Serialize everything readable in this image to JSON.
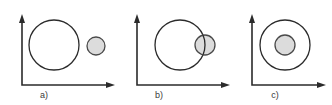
{
  "figure": {
    "width": 332,
    "height": 105,
    "background_color": "#ffffff",
    "stroke_color": "#2b2b2b",
    "fill_gray": "#dcdcdc",
    "small_circle_stroke": "#4a4a4a"
  },
  "panels": [
    {
      "id": "panel-a",
      "label": "a)",
      "label_x": 44,
      "label_y": 98,
      "relation": "disjoint",
      "axis": {
        "origin_x": 22,
        "origin_y": 85,
        "y_top": 14,
        "x_right": 115
      },
      "large_circle": {
        "cx": 54,
        "cy": 45,
        "r": 25,
        "fill": "#ffffff"
      },
      "small_circle": {
        "cx": 96,
        "cy": 46,
        "r": 9,
        "fill": "#dcdcdc"
      }
    },
    {
      "id": "panel-b",
      "label": "b)",
      "label_x": 159,
      "label_y": 98,
      "relation": "overlapping",
      "axis": {
        "origin_x": 137,
        "origin_y": 85,
        "y_top": 14,
        "x_right": 230
      },
      "large_circle": {
        "cx": 180,
        "cy": 45,
        "r": 25,
        "fill": "#ffffff"
      },
      "small_circle": {
        "cx": 205,
        "cy": 45,
        "r": 10,
        "fill": "#dcdcdc"
      }
    },
    {
      "id": "panel-c",
      "label": "c)",
      "label_x": 275,
      "label_y": 98,
      "relation": "contained",
      "axis": {
        "origin_x": 252,
        "origin_y": 85,
        "y_top": 14,
        "x_right": 326
      },
      "large_circle": {
        "cx": 285,
        "cy": 45,
        "r": 25,
        "fill": "#ffffff"
      },
      "small_circle": {
        "cx": 285,
        "cy": 45,
        "r": 10,
        "fill": "#dcdcdc"
      }
    }
  ]
}
